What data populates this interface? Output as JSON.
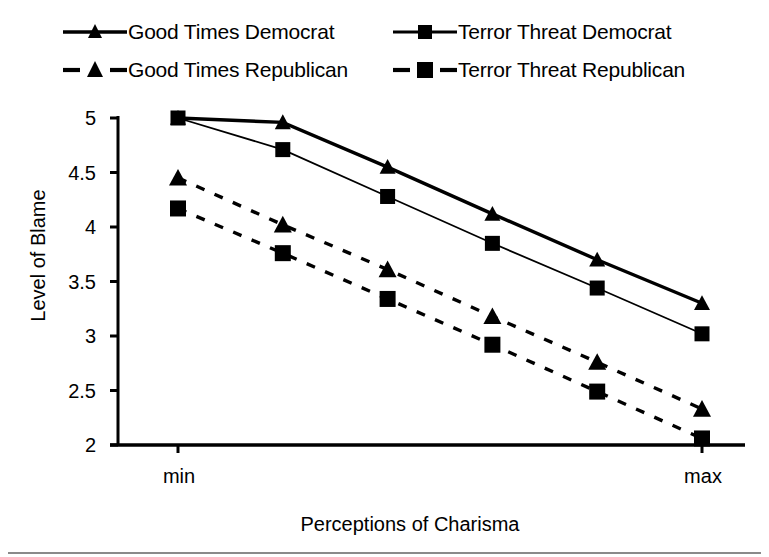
{
  "chart_data": {
    "type": "line",
    "title": "",
    "xlabel": "Perceptions of Charisma",
    "ylabel": "Level of Blame",
    "x": [
      0,
      1,
      2,
      3,
      4,
      5
    ],
    "categories": [
      "min",
      "",
      "",
      "",
      "",
      "max"
    ],
    "xtick_labels": [
      "min",
      "max"
    ],
    "ytick_labels": [
      "5",
      "4.5",
      "4",
      "3.5",
      "3",
      "2.5",
      "2"
    ],
    "ytick_values": [
      5,
      4.5,
      4,
      3.5,
      3,
      2.5,
      2
    ],
    "ylim": [
      2,
      5
    ],
    "xlim": [
      0,
      5
    ],
    "grid": false,
    "legend_position": "top",
    "series": [
      {
        "name": "Good Times Democrat",
        "marker": "triangle",
        "linestyle": "solid",
        "linewidth": 3.4,
        "color": "#000000",
        "values": [
          5.0,
          4.96,
          4.55,
          4.12,
          3.7,
          3.3
        ]
      },
      {
        "name": "Terror Threat Democrat",
        "marker": "square",
        "linestyle": "solid",
        "linewidth": 1.8,
        "color": "#000000",
        "values": [
          5.0,
          4.71,
          4.28,
          3.85,
          3.44,
          3.02
        ]
      },
      {
        "name": "Good Times Republican",
        "marker": "triangle",
        "linestyle": "dashed",
        "linewidth": 3.4,
        "color": "#000000",
        "values": [
          4.45,
          4.02,
          3.61,
          3.18,
          2.76,
          2.33
        ]
      },
      {
        "name": "Terror Threat Republican",
        "marker": "square",
        "linestyle": "dashed",
        "linewidth": 3.4,
        "color": "#000000",
        "values": [
          4.17,
          3.76,
          3.34,
          2.92,
          2.49,
          2.06
        ]
      }
    ]
  },
  "legend": {
    "entries": [
      {
        "label": "Good Times Democrat"
      },
      {
        "label": "Terror Threat Democrat"
      },
      {
        "label": "Good Times Republican"
      },
      {
        "label": "Terror Threat Republican"
      }
    ]
  },
  "axes": {
    "y_label": "Level of Blame",
    "x_label": "Perceptions of Charisma",
    "x_min_label": "min",
    "x_max_label": "max",
    "y_labels": [
      "5",
      "4.5",
      "4",
      "3.5",
      "3",
      "2.5",
      "2"
    ]
  }
}
